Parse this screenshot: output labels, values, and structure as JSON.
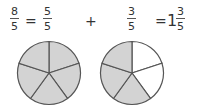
{
  "equation": {
    "term1": {
      "numerator": "8",
      "denominator": "5"
    },
    "equals1": "=",
    "term2": {
      "numerator": "5",
      "denominator": "5"
    },
    "plus": "+",
    "term3": {
      "numerator": "3",
      "denominator": "5"
    },
    "equals2": "=",
    "result": {
      "whole": "1",
      "numerator": "3",
      "denominator": "5"
    }
  },
  "pies": [
    {
      "slices": 5,
      "shaded": 5,
      "fill": "#d3d3d3",
      "empty": "#ffffff"
    },
    {
      "slices": 5,
      "shaded": 3,
      "fill": "#d3d3d3",
      "empty": "#ffffff"
    }
  ],
  "colors": {
    "stroke": "#555555",
    "shaded": "#d3d3d3"
  }
}
